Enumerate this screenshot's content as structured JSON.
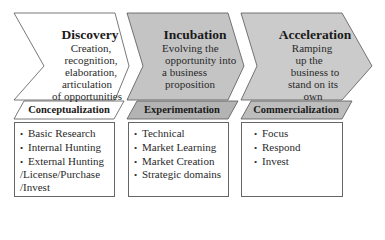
{
  "colors": {
    "discovery_fill": "#ffffff",
    "incubation_fill": "#c4c4c4",
    "acceleration_fill": "#cbcbcb",
    "band_gray": "#b5b5b5",
    "stroke": "#555555"
  },
  "stages": [
    {
      "title": "Discovery",
      "description": [
        "Creation,",
        "recognition,",
        "elaboration,",
        "articulation",
        "of opportunities"
      ],
      "band": "Conceptualization",
      "items": [
        "Basic Research",
        "Internal Hunting",
        "External Hunting"
      ],
      "continuation": [
        "/License/Purchase",
        "/Invest"
      ]
    },
    {
      "title": "Incubation",
      "description": [
        "Evolving the",
        "opportunity into",
        "a business",
        "proposition"
      ],
      "band": "Experimentation",
      "items": [
        "Technical",
        "Market Learning",
        "Market Creation",
        "Strategic domains"
      ]
    },
    {
      "title": "Acceleration",
      "description": [
        "Ramping",
        "up the",
        "business to",
        "stand on its",
        "own"
      ],
      "band": "Commercialization",
      "items": [
        "Focus",
        "Respond",
        "Invest"
      ]
    }
  ],
  "bullet_glyph": "•"
}
